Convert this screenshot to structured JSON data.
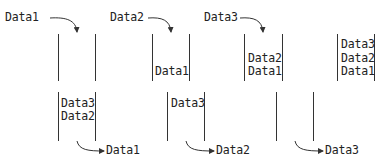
{
  "enqueue_row": {
    "steps": [
      {
        "incoming": "Data1",
        "contents_top_to_bottom": []
      },
      {
        "incoming": "Data2",
        "contents_top_to_bottom": [
          "Data1"
        ]
      },
      {
        "incoming": "Data3",
        "contents_top_to_bottom": [
          "Data2",
          "Data1"
        ]
      },
      {
        "incoming": null,
        "contents_top_to_bottom": [
          "Data3",
          "Data2",
          "Data1"
        ]
      }
    ]
  },
  "dequeue_row": {
    "steps": [
      {
        "contents_top_to_bottom": [
          "Data3",
          "Data2"
        ],
        "outgoing": "Data1"
      },
      {
        "contents_top_to_bottom": [
          "Data3"
        ],
        "outgoing": "Data2"
      },
      {
        "contents_top_to_bottom": [],
        "outgoing": "Data3"
      }
    ]
  },
  "colors": {
    "line": "#333333",
    "text": "#222222",
    "background": "#ffffff"
  }
}
